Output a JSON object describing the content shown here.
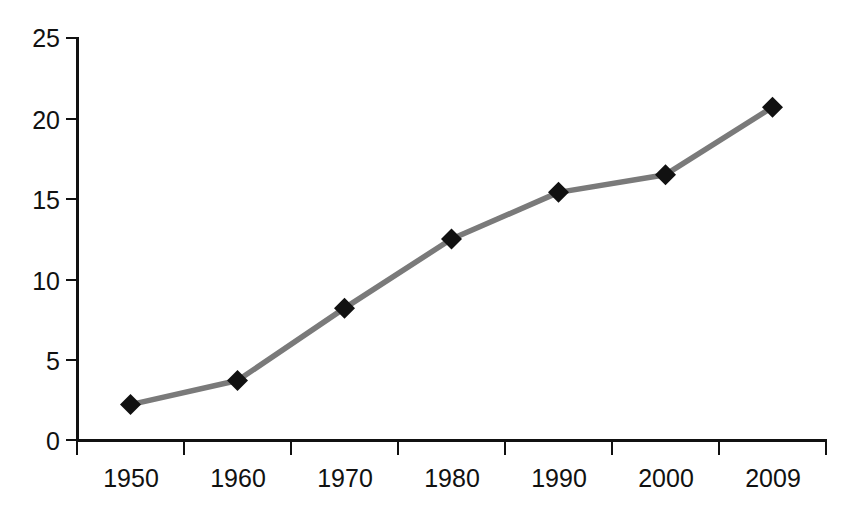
{
  "chart_data": {
    "type": "line",
    "title": "",
    "xlabel": "",
    "ylabel": "",
    "categories": [
      "1950",
      "1960",
      "1970",
      "1980",
      "1990",
      "2000",
      "2009"
    ],
    "values": [
      2.2,
      3.7,
      8.2,
      12.5,
      15.4,
      16.5,
      20.7
    ],
    "series": [
      {
        "name": "",
        "values": [
          2.2,
          3.7,
          8.2,
          12.5,
          15.4,
          16.5,
          20.7
        ]
      }
    ],
    "ylim": [
      0,
      25
    ],
    "yticks": [
      0,
      5,
      10,
      15,
      20,
      25
    ],
    "ytick_labels": [
      "0",
      "5",
      "10",
      "15",
      "20",
      "25"
    ],
    "xtick_labels": [
      "1950",
      "1960",
      "1970",
      "1980",
      "1990",
      "2000",
      "2009"
    ],
    "grid": false,
    "legend": false,
    "legend_position": "none",
    "line_color": "#7a7a7a",
    "marker_color": "#111111",
    "marker_shape": "diamond",
    "axis_color": "#111111"
  },
  "axes": {
    "y_ticks": [
      {
        "label": "25",
        "value": 25
      },
      {
        "label": "20",
        "value": 20
      },
      {
        "label": "15",
        "value": 15
      },
      {
        "label": "10",
        "value": 10
      },
      {
        "label": "5",
        "value": 5
      },
      {
        "label": "0",
        "value": 0
      }
    ],
    "x_ticks": [
      {
        "label": "1950"
      },
      {
        "label": "1960"
      },
      {
        "label": "1970"
      },
      {
        "label": "1980"
      },
      {
        "label": "1990"
      },
      {
        "label": "2000"
      },
      {
        "label": "2009"
      }
    ]
  },
  "title_sliver": {
    "text": ""
  }
}
